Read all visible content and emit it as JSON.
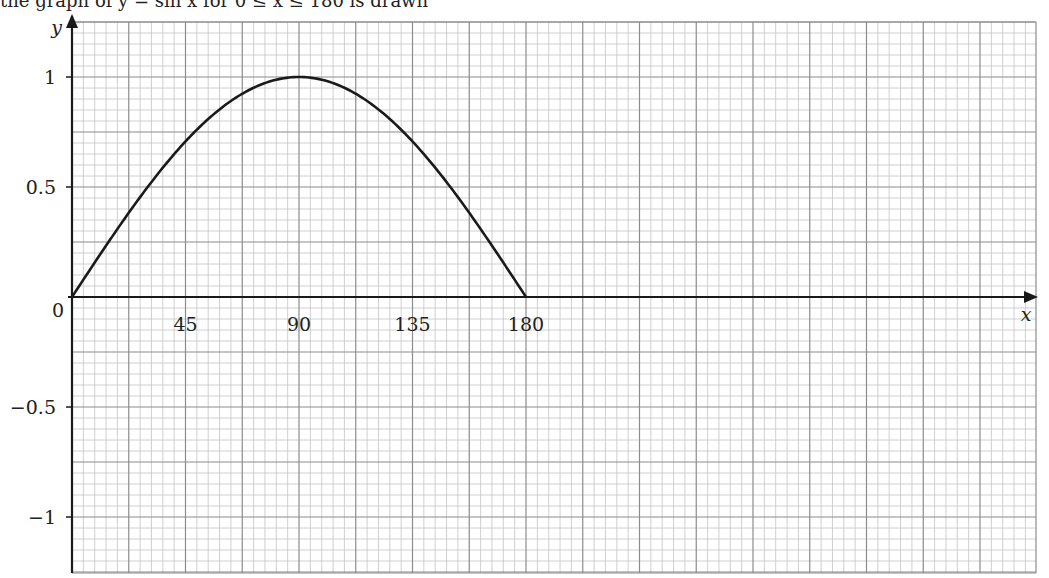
{
  "header_fragment": "the graph of y = sin x for 0 ≤ x ≤ 180 is drawn",
  "chart_data": {
    "type": "line",
    "title": "",
    "xlabel": "x",
    "ylabel": "y",
    "xlim": [
      0,
      360
    ],
    "ylim": [
      -1.25,
      1.1
    ],
    "grid": true,
    "x_ticks": [
      {
        "value": 0,
        "label": "0"
      },
      {
        "value": 45,
        "label": "45"
      },
      {
        "value": 90,
        "label": "90"
      },
      {
        "value": 135,
        "label": "135"
      },
      {
        "value": 180,
        "label": "180"
      }
    ],
    "y_ticks": [
      {
        "value": 1,
        "label": "1"
      },
      {
        "value": 0.5,
        "label": "0.5"
      },
      {
        "value": -0.5,
        "label": "−0.5"
      },
      {
        "value": -1,
        "label": "−1"
      }
    ],
    "series": [
      {
        "name": "y = sin x",
        "x": [
          0,
          15,
          30,
          45,
          60,
          75,
          90,
          105,
          120,
          135,
          150,
          165,
          180
        ],
        "values": [
          0,
          0.259,
          0.5,
          0.707,
          0.866,
          0.966,
          1,
          0.966,
          0.866,
          0.707,
          0.5,
          0.259,
          0
        ]
      }
    ]
  },
  "colors": {
    "curve": "#1a1a1a",
    "axis": "#1a1a1a",
    "grid_major": "#8c8c8c",
    "grid_minor": "#c4c4c4"
  }
}
